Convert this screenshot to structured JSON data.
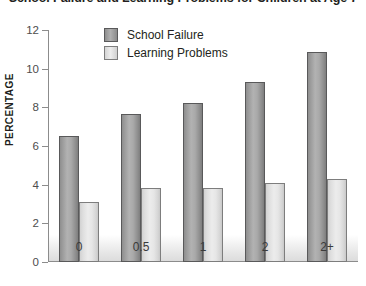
{
  "chart_data": {
    "type": "bar",
    "title": "School Failure and Learning Problems for Children at Age 7",
    "xlabel": "",
    "ylabel": "PERCENTAGE",
    "categories": [
      "0",
      "0.5",
      "1",
      "2",
      "2+"
    ],
    "series": [
      {
        "name": "School Failure",
        "color": "#a8a8a8",
        "values": [
          6.5,
          7.65,
          8.2,
          9.3,
          10.85
        ]
      },
      {
        "name": "Learning Problems",
        "color": "#e4e4e4",
        "values": [
          3.1,
          3.85,
          3.85,
          4.1,
          4.3
        ]
      }
    ],
    "ylim": [
      0,
      12
    ],
    "yticks": [
      0,
      2,
      4,
      6,
      8,
      10,
      12
    ],
    "ytick_labels": [
      "0",
      "2",
      "4",
      "6",
      "8",
      "10",
      "12"
    ],
    "grid": false,
    "legend_position": "top-center"
  }
}
